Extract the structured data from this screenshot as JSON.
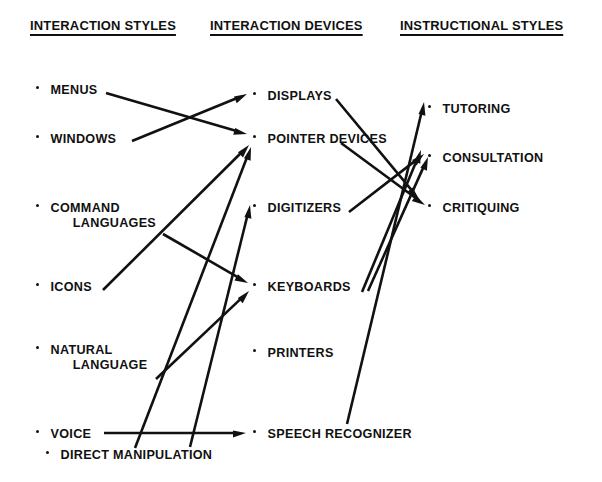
{
  "diagram": {
    "ink_color": "#111111",
    "background_color": "#ffffff",
    "columns": [
      {
        "id": "interaction-styles",
        "header": "INTERACTION STYLES",
        "header_x": 30,
        "header_y": 18,
        "items": [
          {
            "id": "menus",
            "lines": [
              "MENUS"
            ],
            "x": 36,
            "y": 82
          },
          {
            "id": "windows",
            "lines": [
              "WINDOWS"
            ],
            "x": 36,
            "y": 131
          },
          {
            "id": "command-languages",
            "lines": [
              "COMMAND",
              "LANGUAGES"
            ],
            "x": 36,
            "y": 200
          },
          {
            "id": "icons",
            "lines": [
              "ICONS"
            ],
            "x": 36,
            "y": 279
          },
          {
            "id": "natural-language",
            "lines": [
              "NATURAL",
              "LANGUAGE"
            ],
            "x": 36,
            "y": 342
          },
          {
            "id": "voice",
            "lines": [
              "VOICE"
            ],
            "x": 36,
            "y": 426
          },
          {
            "id": "direct-manipulation",
            "lines": [
              "DIRECT MANIPULATION"
            ],
            "x": 46,
            "y": 447
          }
        ]
      },
      {
        "id": "interaction-devices",
        "header": "INTERACTION DEVICES",
        "header_x": 210,
        "header_y": 18,
        "items": [
          {
            "id": "displays",
            "lines": [
              "DISPLAYS"
            ],
            "x": 253,
            "y": 88
          },
          {
            "id": "pointer-devices",
            "lines": [
              "POINTER DEVICES"
            ],
            "x": 253,
            "y": 131
          },
          {
            "id": "digitizers",
            "lines": [
              "DIGITIZERS"
            ],
            "x": 253,
            "y": 200
          },
          {
            "id": "keyboards",
            "lines": [
              "KEYBOARDS"
            ],
            "x": 253,
            "y": 279
          },
          {
            "id": "printers",
            "lines": [
              "PRINTERS"
            ],
            "x": 253,
            "y": 345
          },
          {
            "id": "speech-recognizer",
            "lines": [
              "SPEECH RECOGNIZER"
            ],
            "x": 253,
            "y": 426
          }
        ]
      },
      {
        "id": "instructional-styles",
        "header": "INSTRUCTIONAL  STYLES",
        "header_x": 400,
        "header_y": 18,
        "items": [
          {
            "id": "tutoring",
            "lines": [
              "TUTORING"
            ],
            "x": 428,
            "y": 101
          },
          {
            "id": "consultation",
            "lines": [
              "CONSULTATION"
            ],
            "x": 428,
            "y": 150
          },
          {
            "id": "critiquing",
            "lines": [
              "CRITIQUING"
            ],
            "x": 428,
            "y": 200
          }
        ]
      }
    ],
    "edges": [
      {
        "id": "menus-to-pointer-devices",
        "from": "menus",
        "to": "pointer-devices",
        "x1": 106,
        "y1": 93,
        "x2": 247,
        "y2": 134
      },
      {
        "id": "windows-to-displays",
        "from": "windows",
        "to": "displays",
        "x1": 132,
        "y1": 141,
        "x2": 247,
        "y2": 94
      },
      {
        "id": "command-languages-to-keyboards",
        "from": "command-languages",
        "to": "keyboards",
        "x1": 163,
        "y1": 234,
        "x2": 248,
        "y2": 283
      },
      {
        "id": "icons-to-pointer-devices",
        "from": "icons",
        "to": "pointer-devices",
        "x1": 103,
        "y1": 290,
        "x2": 249,
        "y2": 145
      },
      {
        "id": "natural-language-to-keyboards",
        "from": "natural-language",
        "to": "keyboards",
        "x1": 156,
        "y1": 379,
        "x2": 249,
        "y2": 291
      },
      {
        "id": "voice-to-speech-recognizer",
        "from": "voice",
        "to": "speech-recognizer",
        "x1": 104,
        "y1": 433,
        "x2": 246,
        "y2": 433
      },
      {
        "id": "direct-manipulation-to-pointer-devices",
        "from": "direct-manipulation",
        "to": "pointer-devices",
        "x1": 135,
        "y1": 448,
        "x2": 251,
        "y2": 147
      },
      {
        "id": "direct-manipulation-to-digitizers",
        "from": "direct-manipulation",
        "to": "digitizers",
        "x1": 190,
        "y1": 447,
        "x2": 250,
        "y2": 205
      },
      {
        "id": "displays-to-critiquing",
        "from": "displays",
        "to": "critiquing",
        "x1": 336,
        "y1": 99,
        "x2": 419,
        "y2": 199
      },
      {
        "id": "pointer-devices-to-critiquing",
        "from": "pointer-devices",
        "to": "critiquing",
        "x1": 341,
        "y1": 143,
        "x2": 425,
        "y2": 205
      },
      {
        "id": "digitizers-to-consultation",
        "from": "digitizers",
        "to": "consultation",
        "x1": 349,
        "y1": 212,
        "x2": 424,
        "y2": 154
      },
      {
        "id": "keyboards-to-consultation-a",
        "from": "keyboards",
        "to": "consultation",
        "x1": 362,
        "y1": 292,
        "x2": 421,
        "y2": 150
      },
      {
        "id": "keyboards-to-consultation-b",
        "from": "keyboards",
        "to": "consultation",
        "x1": 368,
        "y1": 291,
        "x2": 428,
        "y2": 157
      },
      {
        "id": "speech-recognizer-to-tutoring",
        "from": "speech-recognizer",
        "to": "tutoring",
        "x1": 347,
        "y1": 424,
        "x2": 424,
        "y2": 102
      }
    ]
  }
}
